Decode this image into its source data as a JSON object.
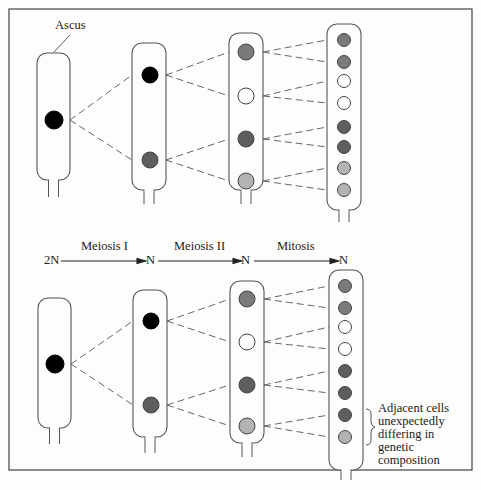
{
  "title_label": "Ascus",
  "stage_bar": {
    "start": "2N",
    "stages": [
      {
        "label": "Meiosis I",
        "result": "N"
      },
      {
        "label": "Meiosis II",
        "result": "N"
      },
      {
        "label": "Mitosis",
        "result": "N"
      }
    ]
  },
  "annotation": {
    "lines": [
      "Adjacent cells",
      "unexpectedly",
      "differing in",
      "genetic",
      "composition"
    ]
  },
  "colors": {
    "black": "#000000",
    "dark_gray": "#5e5e5e",
    "mid_gray": "#7a7a7a",
    "light_gray": "#b3b3b3",
    "white": "#ffffff",
    "outline": "#555555"
  },
  "rows": [
    {
      "name": "expected",
      "asci": [
        {
          "stage": "2N",
          "nuclei": [
            "black"
          ]
        },
        {
          "stage": "N after Meiosis I",
          "nuclei": [
            "black",
            "dark_gray"
          ]
        },
        {
          "stage": "N after Meiosis II",
          "nuclei": [
            "mid_gray",
            "white",
            "dark_gray",
            "light_gray"
          ]
        },
        {
          "stage": "N after Mitosis",
          "nuclei": [
            "mid_gray",
            "mid_gray",
            "white",
            "white",
            "dark_gray",
            "dark_gray",
            "light_gray",
            "light_gray"
          ]
        }
      ]
    },
    {
      "name": "unexpected",
      "asci": [
        {
          "stage": "2N",
          "nuclei": [
            "black"
          ]
        },
        {
          "stage": "N after Meiosis I",
          "nuclei": [
            "black",
            "dark_gray"
          ]
        },
        {
          "stage": "N after Meiosis II",
          "nuclei": [
            "mid_gray",
            "white",
            "dark_gray",
            "light_gray"
          ]
        },
        {
          "stage": "N after Mitosis",
          "nuclei": [
            "mid_gray",
            "mid_gray",
            "white",
            "white",
            "dark_gray",
            "dark_gray",
            "dark_gray",
            "light_gray"
          ]
        }
      ]
    }
  ]
}
